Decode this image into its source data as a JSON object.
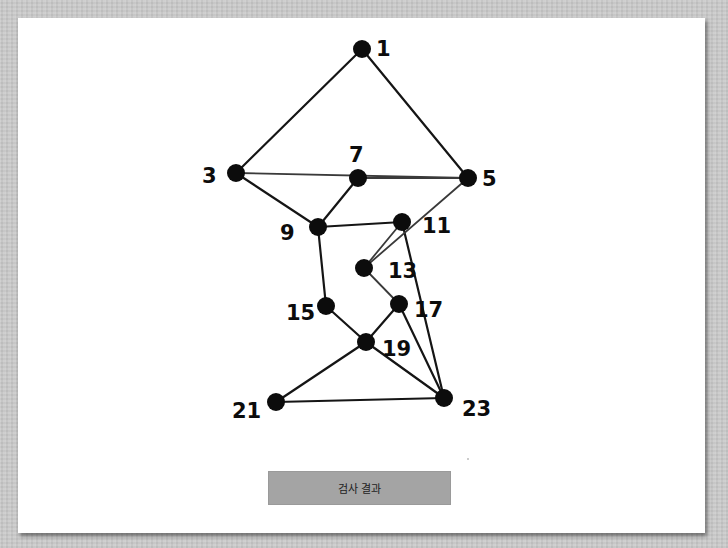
{
  "diagram": {
    "nodes": [
      {
        "id": "1",
        "label": "1"
      },
      {
        "id": "3",
        "label": "3"
      },
      {
        "id": "5",
        "label": "5"
      },
      {
        "id": "7",
        "label": "7"
      },
      {
        "id": "9",
        "label": "9"
      },
      {
        "id": "11",
        "label": "11"
      },
      {
        "id": "13",
        "label": "13"
      },
      {
        "id": "15",
        "label": "15"
      },
      {
        "id": "17",
        "label": "17"
      },
      {
        "id": "19",
        "label": "19"
      },
      {
        "id": "21",
        "label": "21"
      },
      {
        "id": "23",
        "label": "23"
      }
    ],
    "edges": [
      [
        "1",
        "3"
      ],
      [
        "1",
        "5"
      ],
      [
        "3",
        "5"
      ],
      [
        "7",
        "5"
      ],
      [
        "3",
        "9"
      ],
      [
        "7",
        "9"
      ],
      [
        "9",
        "11"
      ],
      [
        "9",
        "15"
      ],
      [
        "11",
        "13"
      ],
      [
        "11",
        "23"
      ],
      [
        "5",
        "13"
      ],
      [
        "13",
        "17"
      ],
      [
        "15",
        "19"
      ],
      [
        "17",
        "19"
      ],
      [
        "17",
        "23"
      ],
      [
        "19",
        "21"
      ],
      [
        "19",
        "23"
      ],
      [
        "21",
        "23"
      ]
    ]
  },
  "button": {
    "label": "검사 결과"
  }
}
